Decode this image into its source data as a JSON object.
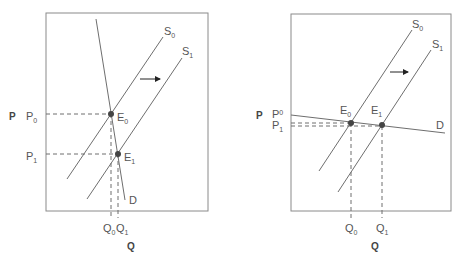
{
  "panels": [
    {
      "id": "left",
      "description": "Inelastic demand, supply shifts right",
      "axis": {
        "x": "Q",
        "y": "P"
      },
      "curves": {
        "s0": {
          "main": "S",
          "sub": "0"
        },
        "s1": {
          "main": "S",
          "sub": "1"
        },
        "d": "D"
      },
      "points": {
        "e0": {
          "main": "E",
          "sub": "0"
        },
        "e1": {
          "main": "E",
          "sub": "1"
        }
      },
      "price_labels": {
        "p0": {
          "main": "P",
          "sub": "0"
        },
        "p1": {
          "main": "P",
          "sub": "1"
        }
      },
      "quantity_labels": {
        "q0": {
          "main": "Q",
          "sub": "0"
        },
        "q1": {
          "main": "Q",
          "sub": "1"
        }
      }
    },
    {
      "id": "right",
      "description": "Elastic demand, supply shifts right",
      "axis": {
        "x": "Q",
        "y": "P"
      },
      "curves": {
        "s0": {
          "main": "S",
          "sub": "0"
        },
        "s1": {
          "main": "S",
          "sub": "1"
        },
        "d": "D"
      },
      "points": {
        "e0": {
          "main": "E",
          "sub": "0"
        },
        "e1": {
          "main": "E",
          "sub": "1"
        }
      },
      "price_labels": {
        "p0": {
          "main": "P",
          "sub": "0"
        },
        "p1": {
          "main": "P",
          "sub": "1"
        }
      },
      "quantity_labels": {
        "q0": {
          "main": "Q",
          "sub": "0"
        },
        "q1": {
          "main": "Q",
          "sub": "1"
        }
      }
    }
  ],
  "colors": {
    "line": "#6e6e6e",
    "frame": "#8a8a8a",
    "point": "#444444",
    "text": "#555555"
  }
}
